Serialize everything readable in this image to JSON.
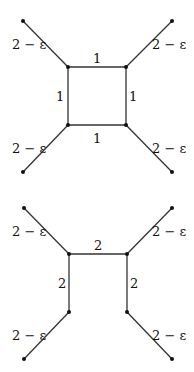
{
  "diagrams": [
    {
      "name": "square-graph-unit-edges",
      "labels": {
        "leaf_tl": "2 − ε",
        "leaf_tr": "2 − ε",
        "leaf_bl": "2 − ε",
        "leaf_br": "2 − ε",
        "top": "1",
        "bottom": "1",
        "left": "1",
        "right": "1"
      }
    },
    {
      "name": "open-square-graph",
      "labels": {
        "leaf_tl": "2 − ε",
        "leaf_tr": "2 − ε",
        "leaf_bl": "2 − ε",
        "leaf_br": "2 − ε",
        "top": "2",
        "left": "2",
        "right": "2"
      }
    }
  ]
}
